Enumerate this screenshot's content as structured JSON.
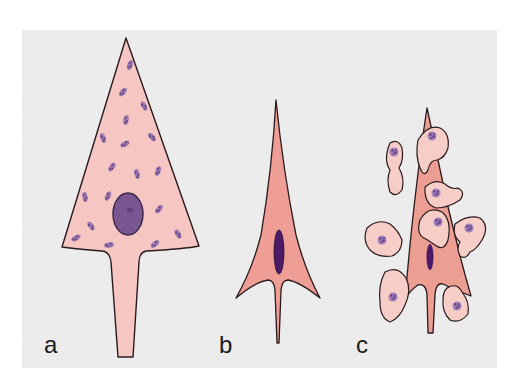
{
  "figure": {
    "background": "#ffffff",
    "panel_background": "#ebebeb",
    "colors": {
      "cell_a_fill": "#f6c7c2",
      "cell_b_fill": "#ee9e94",
      "cell_c_fill": "#ec9e93",
      "satellite_fill": "#f7cdc8",
      "outline": "#2a1a1e",
      "nucleus_large": "#7a5690",
      "nucleus_elongated": "#4b1b68",
      "granule": "#7a5a98"
    },
    "panels": [
      {
        "id": "a",
        "label": "a",
        "description": "Large pyramidal cell with round nucleus and scattered Nissl granules"
      },
      {
        "id": "b",
        "label": "b",
        "description": "Shrunken, darkly stained cell with elongated nucleus"
      },
      {
        "id": "c",
        "label": "c",
        "description": "Shrunken cell surrounded by satellite glial cells (satellitosis)"
      }
    ]
  }
}
